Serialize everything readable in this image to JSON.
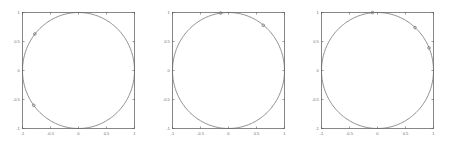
{
  "figure": {
    "title": "",
    "panel_count": 3,
    "background_color": "#ffffff",
    "axis_color": "#595959",
    "grid_color": "#d8d8d8",
    "curve_color": "#6b6b6b"
  },
  "chart_data": [
    {
      "type": "line",
      "title": "",
      "xlabel": "",
      "ylabel": "",
      "xlim": [
        -1,
        1
      ],
      "ylim": [
        -1,
        1
      ],
      "grid": true,
      "legend": null,
      "xticks": [
        -1,
        -0.5,
        0,
        0.5,
        1
      ],
      "yticks": [
        -1,
        -0.5,
        0,
        0.5,
        1
      ],
      "xticklabels": [
        "-1",
        "-0.5",
        "0",
        "0.5",
        "1"
      ],
      "yticklabels": [
        "-1",
        "-0.5",
        "0",
        "0.5",
        "1"
      ],
      "series": [
        {
          "name": "unit-circle",
          "shape": "circle",
          "center": [
            0,
            0
          ],
          "radius": 1,
          "markers": [
            {
              "x": -0.78,
              "y": 0.63
            },
            {
              "x": -0.8,
              "y": -0.6
            }
          ]
        }
      ]
    },
    {
      "type": "line",
      "title": "",
      "xlabel": "",
      "ylabel": "",
      "xlim": [
        -1,
        1
      ],
      "ylim": [
        -1,
        1
      ],
      "grid": true,
      "legend": null,
      "xticks": [
        -1,
        -0.5,
        0,
        0.5,
        1
      ],
      "yticks": [
        -1,
        -0.5,
        0,
        0.5,
        1
      ],
      "xticklabels": [
        "-1",
        "-0.5",
        "0",
        "0.5",
        "1"
      ],
      "yticklabels": [
        "-1",
        "-0.5",
        "0",
        "0.5",
        "1"
      ],
      "series": [
        {
          "name": "unit-circle",
          "shape": "circle",
          "center": [
            0,
            0
          ],
          "radius": 1,
          "markers": [
            {
              "x": -0.14,
              "y": 0.99
            },
            {
              "x": 0.62,
              "y": 0.78
            }
          ]
        }
      ]
    },
    {
      "type": "line",
      "title": "",
      "xlabel": "",
      "ylabel": "",
      "xlim": [
        -1,
        1
      ],
      "ylim": [
        -1,
        1
      ],
      "grid": true,
      "legend": null,
      "xticks": [
        -1,
        -0.5,
        0,
        0.5,
        1
      ],
      "yticks": [
        -1,
        -0.5,
        0,
        0.5,
        1
      ],
      "xticklabels": [
        "-1",
        "-0.5",
        "0",
        "0.5",
        "1"
      ],
      "yticklabels": [
        "-1",
        "-0.5",
        "0",
        "0.5",
        "1"
      ],
      "series": [
        {
          "name": "unit-circle",
          "shape": "circle",
          "center": [
            0,
            0
          ],
          "radius": 1,
          "markers": [
            {
              "x": -0.09,
              "y": 1.0
            },
            {
              "x": 0.67,
              "y": 0.74
            },
            {
              "x": 0.92,
              "y": 0.39
            }
          ]
        }
      ]
    }
  ]
}
